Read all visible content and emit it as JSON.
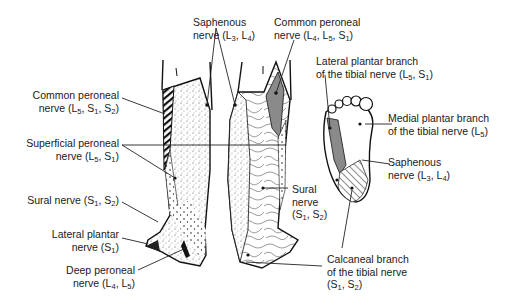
{
  "figure": {
    "views": [
      "anterolateral leg",
      "posterior leg",
      "plantar foot"
    ]
  },
  "labels": {
    "saphenous_top": {
      "line1": "Saphenous",
      "line2_pre": "nerve (L",
      "s1": "3",
      "mid": ", L",
      "s2": "4",
      "end": ")"
    },
    "common_peroneal_right": {
      "line1": "Common peroneal",
      "line2_pre": "nerve (L",
      "s1": "4",
      "mid1": ", L",
      "s2": "5",
      "mid2": ", S",
      "s3": "1",
      "end": ")"
    },
    "common_peroneal_left": {
      "line1": "Common peroneal",
      "line2_pre": "nerve (L",
      "s1": "5",
      "mid1": ", S",
      "s2": "1",
      "mid2": ", S",
      "s3": "2",
      "end": ")"
    },
    "lateral_plantar_branch": {
      "line1": "Lateral plantar branch",
      "line2_pre": "of the tibial nerve (L",
      "s1": "5",
      "mid": ", S",
      "s2": "1",
      "end": ")"
    },
    "medial_plantar_branch": {
      "line1": "Medial plantar branch",
      "line2_pre": "of the tibial nerve (L",
      "s1": "5",
      "end": ")"
    },
    "superficial_peroneal": {
      "line1": "Superficial peroneal",
      "line2_pre": "nerve (L",
      "s1": "5",
      "mid": ", S",
      "s2": "1",
      "end": ")"
    },
    "saphenous_foot": {
      "line1": "Saphenous",
      "line2_pre": "nerve (L",
      "s1": "3",
      "mid": ", L",
      "s2": "4",
      "end": ")"
    },
    "sural_left": {
      "line1_pre": "Sural nerve (S",
      "s1": "1",
      "mid": ", S",
      "s2": "2",
      "end": ")"
    },
    "sural_posterior": {
      "line1": "Sural",
      "line2": "nerve",
      "line3_pre": "(S",
      "s1": "1",
      "mid": ", S",
      "s2": "2",
      "end": ")"
    },
    "lateral_plantar_nerve": {
      "line1": "Lateral plantar",
      "line2_pre": "nerve (S",
      "s1": "1",
      "end": ")"
    },
    "deep_peroneal": {
      "line1": "Deep peroneal",
      "line2_pre": "nerve (L",
      "s1": "4",
      "mid": ", L",
      "s2": "5",
      "end": ")"
    },
    "calcaneal_branch": {
      "line1": "Calcaneal branch",
      "line2": "of the tibial nerve",
      "line3_pre": "(S",
      "s1": "1",
      "mid": ", S",
      "s2": "2",
      "end": ")"
    }
  },
  "colors": {
    "ink": "#1a1a1a",
    "shade_gray": "#8a8a8a",
    "background": "#ffffff"
  }
}
